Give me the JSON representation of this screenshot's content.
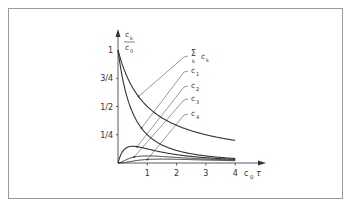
{
  "chart_data": {
    "type": "line",
    "title": "",
    "xlabel": "c0 τ",
    "xlabel_main": "c",
    "xlabel_sub": "0",
    "xlabel_tail": "τ",
    "ylabel": "ck / c0",
    "ylabel_num": "c",
    "ylabel_num_sub": "k",
    "ylabel_den": "c",
    "ylabel_den_sub": "0",
    "xlim": [
      0,
      4
    ],
    "ylim": [
      0,
      1
    ],
    "x_ticks": [
      {
        "value": 1,
        "label": "1"
      },
      {
        "value": 2,
        "label": "2"
      },
      {
        "value": 3,
        "label": "3"
      },
      {
        "value": 4,
        "label": "4"
      }
    ],
    "y_ticks": [
      {
        "value": 0.25,
        "label": "1/4"
      },
      {
        "value": 0.5,
        "label": "1/2"
      },
      {
        "value": 0.75,
        "label": "3/4"
      },
      {
        "value": 1,
        "label": "1"
      }
    ],
    "grid": false,
    "series": [
      {
        "name": "Σk ck",
        "formula": "1/(1+t)",
        "label_main": "Σ",
        "label_sub": "k",
        "label_tail": "c",
        "label_tail_sub": "k",
        "x": [
          0,
          0.5,
          1,
          1.5,
          2,
          3,
          4
        ],
        "values": [
          1,
          0.667,
          0.5,
          0.4,
          0.333,
          0.25,
          0.2
        ]
      },
      {
        "name": "c1",
        "formula": "1/(1+t)^2",
        "label_main": "c",
        "label_sub": "1",
        "x": [
          0,
          0.5,
          1,
          1.5,
          2,
          3,
          4
        ],
        "values": [
          1,
          0.444,
          0.25,
          0.16,
          0.111,
          0.0625,
          0.04
        ]
      },
      {
        "name": "c2",
        "formula": "t/(1+t)^3",
        "label_main": "c",
        "label_sub": "2",
        "x": [
          0,
          0.5,
          1,
          1.5,
          2,
          3,
          4
        ],
        "values": [
          0,
          0.148,
          0.125,
          0.096,
          0.074,
          0.047,
          0.032
        ]
      },
      {
        "name": "c3",
        "formula": "t^2/(1+t)^4",
        "label_main": "c",
        "label_sub": "3",
        "x": [
          0,
          0.5,
          1,
          1.5,
          2,
          3,
          4
        ],
        "values": [
          0,
          0.049,
          0.0625,
          0.058,
          0.049,
          0.035,
          0.026
        ]
      },
      {
        "name": "c4",
        "formula": "t^3/(1+t)^5",
        "label_main": "c",
        "label_sub": "4",
        "x": [
          0,
          0.5,
          1,
          1.5,
          2,
          3,
          4
        ],
        "values": [
          0,
          0.016,
          0.031,
          0.035,
          0.033,
          0.026,
          0.02
        ]
      }
    ],
    "legend": "top-right, with leader lines to curves"
  },
  "colors": {
    "ink": "#333333",
    "frame": "#9a9a9a",
    "background": "#ffffff"
  }
}
